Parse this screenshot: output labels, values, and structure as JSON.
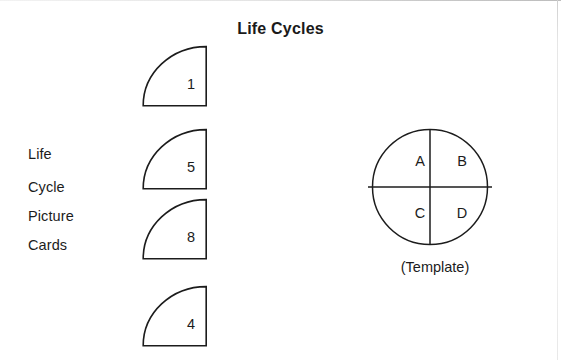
{
  "page": {
    "title": "Life Cycles",
    "background_color": "#ffffff",
    "ink_color": "#1c1c1c"
  },
  "side_label": {
    "lines": [
      "Life",
      "Cycle",
      "Picture",
      "Cards"
    ]
  },
  "cards": [
    {
      "number": "1"
    },
    {
      "number": "5"
    },
    {
      "number": "8"
    },
    {
      "number": "4"
    }
  ],
  "template": {
    "caption": "(Template)",
    "quadrants": {
      "top_left": "A",
      "top_right": "B",
      "bottom_left": "C",
      "bottom_right": "D"
    }
  }
}
